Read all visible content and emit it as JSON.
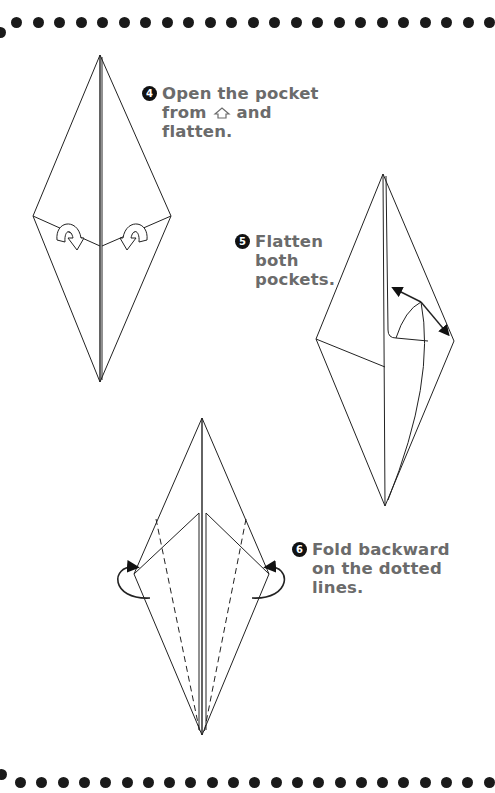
{
  "page": {
    "background": "#ffffff",
    "text_color": "#6b6b6b",
    "line_color": "#222222"
  },
  "steps": [
    {
      "number": "4",
      "lines": [
        "Open the pocket",
        "from ",
        "flatten."
      ],
      "inline_icon": "house-outline-icon",
      "after_icon": " and"
    },
    {
      "number": "5",
      "lines": [
        "Flatten",
        "both",
        "pockets."
      ]
    },
    {
      "number": "6",
      "lines": [
        "Fold backward",
        "on the dotted",
        "lines."
      ]
    }
  ],
  "border": {
    "top_dot_count": 23,
    "bottom_dot_count": 23
  }
}
